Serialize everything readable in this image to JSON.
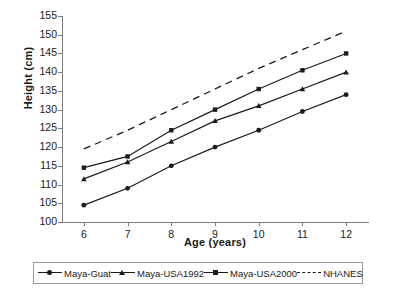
{
  "chart_data": {
    "type": "line",
    "title": "",
    "xlabel": "Age (years)",
    "ylabel": "Height (cm)",
    "x": [
      6,
      7,
      8,
      9,
      10,
      11,
      12
    ],
    "xlim": [
      5.5,
      12.5
    ],
    "ylim": [
      100,
      155
    ],
    "ytick_labels": [
      "100",
      "105",
      "110",
      "115",
      "120",
      "125",
      "130",
      "135",
      "140",
      "145",
      "150",
      "155"
    ],
    "xtick_labels": [
      "6",
      "7",
      "8",
      "9",
      "10",
      "11",
      "12"
    ],
    "grid": false,
    "legend_position": "bottom",
    "series": [
      {
        "name": "Maya-Guat",
        "marker": "dot",
        "style": "solid",
        "color": "#1a1a1a",
        "values": [
          104.5,
          109.0,
          115.0,
          120.0,
          124.5,
          129.5,
          134.0
        ]
      },
      {
        "name": "Maya-USA1992",
        "marker": "triangle",
        "style": "solid",
        "color": "#1a1a1a",
        "values": [
          111.5,
          116.0,
          121.5,
          127.0,
          131.0,
          135.5,
          140.0
        ]
      },
      {
        "name": "Maya-USA2000",
        "marker": "square",
        "style": "solid",
        "color": "#1a1a1a",
        "values": [
          114.5,
          117.5,
          124.5,
          130.0,
          135.5,
          140.5,
          145.0
        ]
      },
      {
        "name": "NHANES",
        "marker": "none",
        "style": "dashed",
        "color": "#1a1a1a",
        "values": [
          119.5,
          124.5,
          130.0,
          135.5,
          141.0,
          146.0,
          151.0
        ]
      }
    ]
  }
}
